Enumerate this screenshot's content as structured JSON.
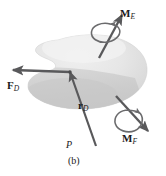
{
  "figure": {
    "caption": "(b)",
    "labels": {
      "force_d": {
        "symbol": "F",
        "subscript": "D",
        "full": "F_D"
      },
      "position_d": {
        "symbol": "r",
        "subscript": "D",
        "full": "r_D"
      },
      "moment_e": {
        "symbol": "M",
        "subscript": "E",
        "full": "M_E"
      },
      "moment_f": {
        "symbol": "M",
        "subscript": "F",
        "full": "M_F"
      },
      "point_p": "P"
    },
    "colors": {
      "body_light": "#e9e9e9",
      "body_mid": "#dcdcdc",
      "body_dark": "#c9c9c9",
      "vector": "#59595b",
      "curl": "#6b6b6d",
      "text": "#1a1a1a",
      "background": "#ffffff"
    },
    "elements": [
      {
        "name": "rigid-body-blob",
        "kind": "shaded-surface"
      },
      {
        "name": "force-vector-FD",
        "kind": "straight-arrow",
        "direction": "left"
      },
      {
        "name": "position-vector-rD",
        "kind": "straight-arrow",
        "direction": "up-left",
        "from": "P"
      },
      {
        "name": "moment-vector-ME",
        "kind": "double-headed-curl-arrow",
        "direction": "up-right"
      },
      {
        "name": "moment-vector-MF",
        "kind": "double-headed-curl-arrow",
        "direction": "down-right"
      },
      {
        "name": "point-marker-P",
        "kind": "point"
      }
    ]
  }
}
